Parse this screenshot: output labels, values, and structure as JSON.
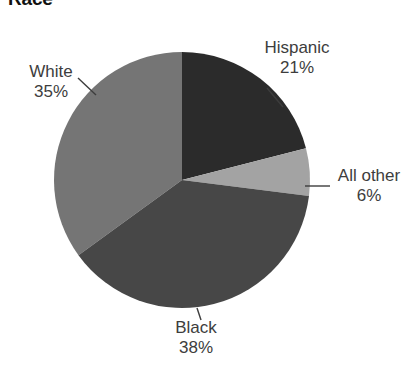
{
  "chart_data": {
    "type": "pie",
    "title": "Race",
    "xlabel": "",
    "ylabel": "",
    "legend_position": "none",
    "grid": false,
    "value_unit": "percent",
    "categories": [
      "Hispanic",
      "All other",
      "Black",
      "White"
    ],
    "values": [
      21,
      6,
      38,
      35
    ],
    "slices": [
      {
        "label": "Hispanic",
        "value": 21,
        "value_text": "21%",
        "color": "#2b2b2b",
        "start_angle": 0,
        "end_angle": 75.6,
        "leader_line": true
      },
      {
        "label": "All other",
        "value": 6,
        "value_text": "6%",
        "color": "#a3a3a3",
        "start_angle": 75.6,
        "end_angle": 97.2,
        "leader_line": true
      },
      {
        "label": "Black",
        "value": 38,
        "value_text": "38%",
        "color": "#474747",
        "start_angle": 97.2,
        "end_angle": 234.0,
        "leader_line": true
      },
      {
        "label": "White",
        "value": 35,
        "value_text": "35%",
        "color": "#757575",
        "start_angle": 234.0,
        "end_angle": 360.0,
        "leader_line": true
      }
    ]
  },
  "chart": {
    "title": "Race",
    "labels": {
      "hispanic": {
        "name": "Hispanic",
        "percent": "21%"
      },
      "all_other": {
        "name": "All other",
        "percent": "6%"
      },
      "black": {
        "name": "Black",
        "percent": "38%"
      },
      "white": {
        "name": "White",
        "percent": "35%"
      }
    }
  },
  "colors": {
    "hispanic": "#2b2b2b",
    "all_other": "#a3a3a3",
    "black": "#474747",
    "white": "#757575",
    "background": "#ffffff",
    "text": "#3d3d3d",
    "title": "#111111",
    "leader_line": "#3d3d3d"
  }
}
